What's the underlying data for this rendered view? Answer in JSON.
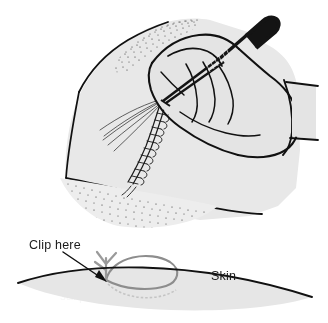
{
  "figure": {
    "background_color": "#ffffff",
    "width": 328,
    "height": 323,
    "panels": [
      {
        "id": "upper-scene",
        "name": "hand-clipping-suture-scene",
        "description": "Gloved hand holding a clip/scissors over a sutured wound on a draped limb"
      },
      {
        "id": "lower-diagram",
        "name": "skin-cross-section-diagram",
        "description": "Cross-section of skin with exiting suture loop and clip point indicator"
      }
    ]
  },
  "labels": {
    "clip_here": "Clip here",
    "skin": "Skin"
  },
  "colors": {
    "ink": "#111111",
    "skin_fill": "#e6e6e6",
    "drape_fill": "#e8e8e8",
    "hand_fill": "#e4e4e4",
    "suture_loop": "#8d8d8d",
    "instrument": "#141414",
    "watermark": "#f1f1f1",
    "page_background": "#ffffff"
  },
  "elements": {
    "instrument_name": "clip-scissors",
    "suture_name": "running-subcuticular-suture",
    "suture_tails_name": "suture-thread-tails",
    "arrow_name": "clip-here-arrow",
    "loop_name": "suture-loop-above-skin",
    "knot_name": "suture-knot",
    "skin_line_name": "skin-surface-line",
    "drape_name": "surgical-drape",
    "hand_name": "surgeon-hand",
    "cuff_name": "glove-cuff",
    "stipple_name": "stipple-shading"
  },
  "watermark": {
    "visible": false,
    "note": "faint scanned bleed-through, effectively invisible"
  }
}
